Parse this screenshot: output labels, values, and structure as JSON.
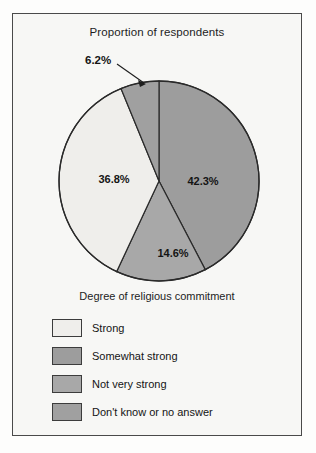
{
  "figure": {
    "title": "Proportion of respondents",
    "axis_caption": "Degree of religious commitment"
  },
  "chart_data": {
    "type": "pie",
    "title": "Proportion of respondents",
    "xlabel": "Degree of religious commitment",
    "ylabel": "Proportion of respondents",
    "legend_position": "bottom-left",
    "grid": false,
    "start_angle_deg": 90,
    "direction": "clockwise",
    "categories": [
      "Strong",
      "Somewhat strong",
      "Not very strong",
      "Don't know or no answer"
    ],
    "values": [
      36.8,
      42.3,
      14.6,
      6.2
    ],
    "labels": [
      "36.8%",
      "42.3%",
      "14.6%",
      "6.2%"
    ],
    "colors": [
      "#efeeeb",
      "#9d9d9d",
      "#a8a8a8",
      "#a0a0a0"
    ],
    "slices": [
      {
        "name": "Somewhat strong",
        "value": 42.3,
        "label": "42.3%",
        "color": "#9d9d9d",
        "label_placement": "inside"
      },
      {
        "name": "Not very strong",
        "value": 14.6,
        "label": "14.6%",
        "color": "#a8a8a8",
        "label_placement": "inside"
      },
      {
        "name": "Strong",
        "value": 36.8,
        "label": "36.8%",
        "color": "#efeeeb",
        "label_placement": "inside"
      },
      {
        "name": "Don't know or no answer",
        "value": 6.2,
        "label": "6.2%",
        "color": "#a0a0a0",
        "label_placement": "callout"
      }
    ]
  },
  "legend": {
    "items": [
      {
        "label": "Strong",
        "color": "#efeeeb"
      },
      {
        "label": "Somewhat strong",
        "color": "#9d9d9d"
      },
      {
        "label": "Not very strong",
        "color": "#a8a8a8"
      },
      {
        "label": "Don't know or no answer",
        "color": "#a0a0a0"
      }
    ]
  }
}
